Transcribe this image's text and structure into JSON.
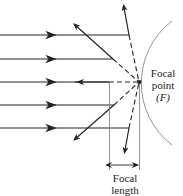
{
  "diagram": {
    "labels": {
      "focal_point_line1": "Focal",
      "focal_point_line2": "point",
      "focal_point_symbol": "(F)",
      "focal_length_line1": "Focal",
      "focal_length_line2": "length"
    },
    "colors": {
      "ray": "#222222",
      "mirror": "#888888",
      "dashed": "#222222"
    },
    "rays": [
      {
        "y": 35,
        "hit_x": 129,
        "reflect_to": [
          123,
          3
        ]
      },
      {
        "y": 59,
        "hit_x": 113,
        "reflect_to": [
          72,
          22
        ]
      },
      {
        "y": 82,
        "hit_x": 109,
        "reflect_to": [
          76,
          82
        ]
      },
      {
        "y": 105,
        "hit_x": 114,
        "reflect_to": [
          72,
          142
        ]
      },
      {
        "y": 128,
        "hit_x": 129,
        "reflect_to": [
          124,
          155
        ]
      }
    ],
    "focal_point": {
      "x": 139,
      "y": 82
    },
    "mirror_vertex_x": 109
  }
}
